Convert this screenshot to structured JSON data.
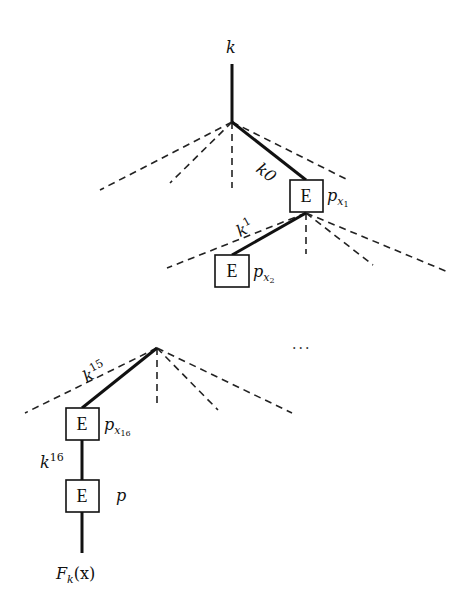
{
  "diagram": {
    "type": "tree-of-encryptions",
    "root_label": "k",
    "output_label": "F",
    "output_subscript": "k",
    "output_arg": "(x)",
    "box_label": "E",
    "edges": [
      {
        "key": "k",
        "sup": "0"
      },
      {
        "key": "k",
        "sup": "1"
      },
      {
        "key": "k",
        "sup": "15"
      },
      {
        "key": "k",
        "sup": "16"
      }
    ],
    "nodes": [
      {
        "box": "E",
        "label": "p",
        "sub": "x",
        "subsub": "1"
      },
      {
        "box": "E",
        "label": "p",
        "sub": "x",
        "subsub": "2"
      },
      {
        "box": "E",
        "label": "p",
        "sub": "x",
        "subsub": "16"
      },
      {
        "box": "E",
        "label": "p",
        "sub": "",
        "subsub": ""
      }
    ],
    "ellipsis": "...",
    "colors": {
      "line": "#111111",
      "dashed": "#222222",
      "background": "#ffffff"
    }
  }
}
